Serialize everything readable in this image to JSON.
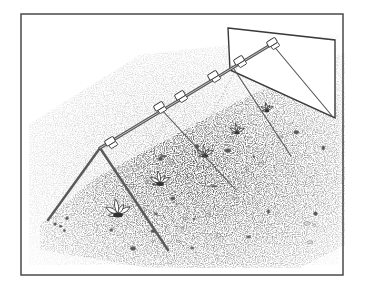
{
  "illustration": {
    "subject": "A-frame plant cover over a garden row",
    "style": "pen-and-ink stipple drawing",
    "colors": {
      "background": "#ffffff",
      "ink": "#3a3a3a",
      "border": "#4a4a4a",
      "stipple": "#9a9a9a",
      "frame_bar": "#6b6b6b"
    },
    "frame_border": {
      "x": 21,
      "y": 14,
      "width": 322,
      "height": 261
    },
    "back_panel": {
      "points": [
        [
          228,
          28
        ],
        [
          335,
          40
        ],
        [
          335,
          118
        ],
        [
          230,
          70
        ]
      ]
    },
    "ridge_bar": {
      "from": [
        100,
        148
      ],
      "to": [
        272,
        44
      ]
    },
    "front_aframe": {
      "apex": [
        100,
        148
      ],
      "left_foot": [
        48,
        220
      ],
      "right_foot": [
        168,
        250
      ]
    },
    "side_legs": [
      {
        "from": [
          160,
          108
        ],
        "to": [
          236,
          190
        ]
      },
      {
        "from": [
          232,
          66
        ],
        "to": [
          291,
          156
        ]
      },
      {
        "from": [
          272,
          44
        ],
        "to": [
          333,
          117
        ]
      }
    ],
    "guide_lines": [
      {
        "from": [
          181,
          97
        ],
        "to": [
          128,
          182
        ]
      },
      {
        "from": [
          240,
          62
        ],
        "to": [
          210,
          118
        ]
      }
    ],
    "clips": [
      {
        "x": 111,
        "y": 143
      },
      {
        "x": 160,
        "y": 108
      },
      {
        "x": 181,
        "y": 97
      },
      {
        "x": 214,
        "y": 77
      },
      {
        "x": 240,
        "y": 62
      },
      {
        "x": 273,
        "y": 44
      }
    ],
    "plants": [
      {
        "x": 118,
        "y": 214,
        "size": 14
      },
      {
        "x": 160,
        "y": 183,
        "size": 11
      },
      {
        "x": 205,
        "y": 155,
        "size": 9
      },
      {
        "x": 237,
        "y": 132,
        "size": 8
      },
      {
        "x": 267,
        "y": 110,
        "size": 7
      }
    ],
    "ground_band": {
      "points": [
        [
          40,
          225
        ],
        [
          95,
          178
        ],
        [
          240,
          100
        ],
        [
          345,
          52
        ],
        [
          345,
          245
        ],
        [
          300,
          268
        ],
        [
          150,
          268
        ],
        [
          40,
          250
        ]
      ]
    }
  }
}
